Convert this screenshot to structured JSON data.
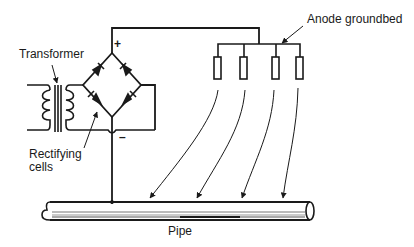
{
  "diagram": {
    "type": "cathodic-protection-impressed-current",
    "labels": {
      "transformer": "Transformer",
      "rectifying_cells_line1": "Rectifying",
      "rectifying_cells_line2": "cells",
      "anode_groundbed": "Anode groundbed",
      "pipe": "Pipe",
      "positive": "+",
      "negative": "–"
    },
    "anodes": [
      {
        "id": "anode-1"
      },
      {
        "id": "anode-2"
      },
      {
        "id": "anode-3"
      },
      {
        "id": "anode-4"
      }
    ],
    "colors": {
      "line": "#1a1a1a",
      "background": "#ffffff"
    }
  }
}
